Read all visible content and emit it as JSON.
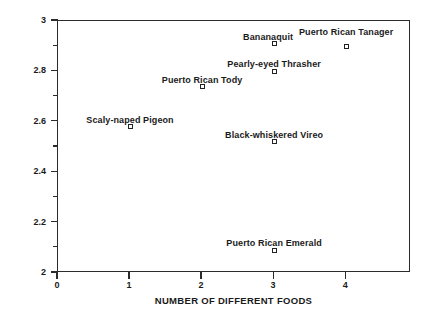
{
  "chart_data": {
    "type": "scatter",
    "title": "",
    "xlabel": "NUMBER OF DIFFERENT FOODS",
    "ylabel": "BIRD HEIGHT DIVERSITY",
    "xlim": [
      0,
      4.9
    ],
    "ylim": [
      2,
      3
    ],
    "grid": false,
    "legend": null,
    "xticks": [
      {
        "value": 0,
        "label": "0"
      },
      {
        "value": 1,
        "label": "1"
      },
      {
        "value": 2,
        "label": "2"
      },
      {
        "value": 3,
        "label": "3"
      },
      {
        "value": 4,
        "label": "4"
      }
    ],
    "yticks_major": [
      {
        "value": 2.0,
        "label": "2"
      },
      {
        "value": 2.2,
        "label": "2.2"
      },
      {
        "value": 2.4,
        "label": "2.4"
      },
      {
        "value": 2.6,
        "label": "2.6"
      },
      {
        "value": 2.8,
        "label": "2.8"
      },
      {
        "value": 3.0,
        "label": "3"
      }
    ],
    "yticks_minor": [
      2.1,
      2.3,
      2.5,
      2.7,
      2.9
    ],
    "points": [
      {
        "label": "Scaly-naped Pigeon",
        "x": 1,
        "y": 2.58,
        "label_dx": 0,
        "label_dy": -12
      },
      {
        "label": "Puerto Rican Tody",
        "x": 2,
        "y": 2.74,
        "label_dx": 0,
        "label_dy": -12
      },
      {
        "label": "Bananaquit",
        "x": 3,
        "y": 2.91,
        "label_dx": -6,
        "label_dy": -12
      },
      {
        "label": "Pearly-eyed Thrasher",
        "x": 3,
        "y": 2.8,
        "label_dx": 0,
        "label_dy": -12
      },
      {
        "label": "Black-whiskered Vireo",
        "x": 3,
        "y": 2.52,
        "label_dx": 0,
        "label_dy": -12
      },
      {
        "label": "Puerto Rican Emerald",
        "x": 3,
        "y": 2.09,
        "label_dx": 0,
        "label_dy": -12
      },
      {
        "label": "Puerto Rican Tanager",
        "x": 4,
        "y": 2.9,
        "label_dx": 0,
        "label_dy": -19
      }
    ]
  },
  "colors": {
    "axis": "#2b2b2b",
    "marker_edge": "#222222",
    "marker_fill": "#ffffff",
    "background": "#ffffff",
    "text": "#1a1a1a"
  }
}
